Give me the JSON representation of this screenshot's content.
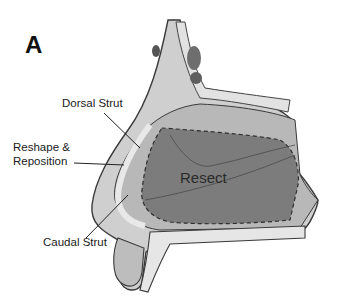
{
  "figure": {
    "panel_letter": "A",
    "labels": {
      "dorsal_strut": "Dorsal Strut",
      "reshape_line1": "Reshape &",
      "reshape_line2": "Reposition",
      "caudal_strut": "Caudal Strut",
      "resect": "Resect"
    },
    "colors": {
      "resect_region": "#7a7a7a",
      "cartilage": "#bdbdbd",
      "bone": "#d9d9d9",
      "outline": "#3a3a3a"
    }
  }
}
